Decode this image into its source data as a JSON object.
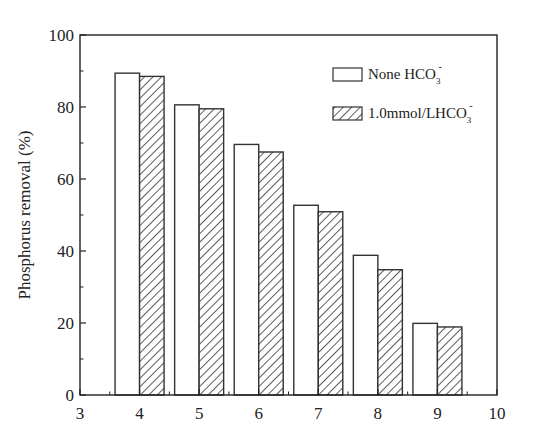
{
  "chart_data": {
    "type": "bar",
    "title": "",
    "xlabel": "",
    "ylabel": "Phosphorus removal (%)",
    "xlim": [
      3,
      10
    ],
    "ylim": [
      0,
      100
    ],
    "x_ticks": [
      "3",
      "4",
      "5",
      "6",
      "7",
      "8",
      "9",
      "10"
    ],
    "y_ticks": [
      "0",
      "20",
      "40",
      "60",
      "80",
      "100"
    ],
    "categories": [
      4,
      5,
      6,
      7,
      8,
      9
    ],
    "series": [
      {
        "name": "None HCO3-",
        "label_main": "None HCO",
        "label_sub": "3",
        "label_sup": "-",
        "pattern": "open",
        "values": [
          89.4,
          80.6,
          69.6,
          52.7,
          38.8,
          19.9
        ]
      },
      {
        "name": "1.0mmol/LHCO3-",
        "label_main": "1.0mmol/LHCO",
        "label_sub": "3",
        "label_sup": "-",
        "pattern": "hatched",
        "values": [
          88.5,
          79.5,
          67.5,
          50.9,
          34.8,
          18.9
        ]
      }
    ],
    "grid": false,
    "legend_position": "upper right",
    "colors": {
      "axis": "#222222",
      "bar_edge": "#333333",
      "bar_fill": "#ffffff",
      "hatch": "#333333"
    }
  }
}
